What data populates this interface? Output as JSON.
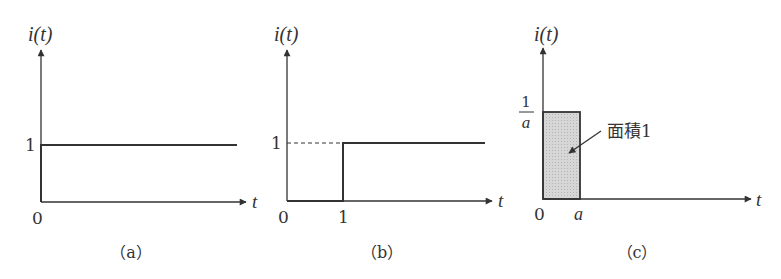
{
  "figure": {
    "panels": [
      {
        "id": "a",
        "caption": "（a）",
        "y_axis_label": "i(t)",
        "x_axis_label": "t",
        "origin_label": "0",
        "y_tick_label": "1",
        "description": "constant signal i(t)=1"
      },
      {
        "id": "b",
        "caption": "（b）",
        "y_axis_label": "i(t)",
        "x_axis_label": "t",
        "origin_label": "0",
        "y_tick_label": "1",
        "x_tick_label": "1",
        "description": "unit step delayed to t=1, dashed guide at level 1"
      },
      {
        "id": "c",
        "caption": "（c）",
        "y_axis_label": "i(t)",
        "x_axis_label": "t",
        "origin_label": "0",
        "y_tick_numerator": "1",
        "y_tick_denominator": "a",
        "x_tick_label": "a",
        "annotation": "面積1",
        "description": "rectangular pulse of height 1/a and width a (area 1)"
      }
    ],
    "colors": {
      "line": "#333333",
      "fill": "#d4d4d4"
    }
  }
}
